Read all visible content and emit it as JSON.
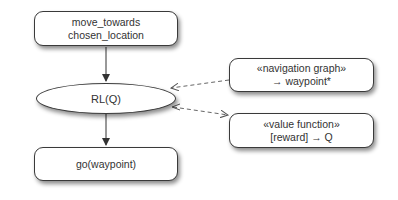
{
  "diagram": {
    "nodes": {
      "move_towards": {
        "line1": "move_towards",
        "line2": "chosen_location"
      },
      "rl": {
        "label": "RL(Q)"
      },
      "go": {
        "label": "go(waypoint)"
      },
      "nav_graph": {
        "line1": "«navigation graph»",
        "line2": "→ waypoint*"
      },
      "value_function": {
        "line1": "«value function»",
        "line2": "[reward] → Q"
      }
    },
    "edges": [
      {
        "from": "move_towards",
        "to": "rl",
        "style": "solid"
      },
      {
        "from": "rl",
        "to": "go",
        "style": "solid"
      },
      {
        "from": "nav_graph",
        "to": "rl",
        "style": "dashed"
      },
      {
        "from": "rl",
        "to": "value_function",
        "style": "dashed"
      }
    ],
    "colors": {
      "stroke": "#3a3a3a",
      "text": "#333333",
      "dashed": "#666666"
    }
  }
}
